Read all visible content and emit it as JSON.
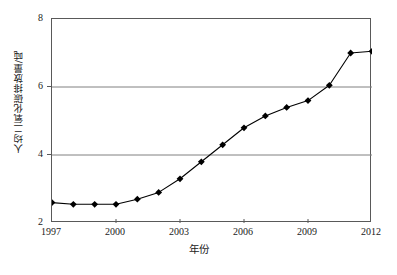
{
  "chart_data": {
    "type": "line",
    "title": "",
    "xlabel": "年份",
    "ylabel": "人均二氧化碳排放量/吨",
    "x": [
      1997,
      1998,
      1999,
      2000,
      2001,
      2002,
      2003,
      2004,
      2005,
      2006,
      2007,
      2008,
      2009,
      2010,
      2011,
      2012
    ],
    "values": [
      2.6,
      2.55,
      2.55,
      2.55,
      2.7,
      2.9,
      3.3,
      3.8,
      4.3,
      4.8,
      5.15,
      5.4,
      5.6,
      6.05,
      7.0,
      7.05
    ],
    "series": [
      {
        "name": "人均二氧化碳排放量",
        "values": [
          2.6,
          2.55,
          2.55,
          2.55,
          2.7,
          2.9,
          3.3,
          3.8,
          4.3,
          4.8,
          5.15,
          5.4,
          5.6,
          6.05,
          7.0,
          7.05
        ]
      }
    ],
    "xlim": [
      1997,
      2012
    ],
    "ylim": [
      2,
      8
    ],
    "xticks": [
      1997,
      2000,
      2003,
      2006,
      2009,
      2012
    ],
    "xtick_labels": [
      "1997",
      "2000",
      "2003",
      "2006",
      "2009",
      "2012"
    ],
    "yticks": [
      2,
      4,
      6,
      8
    ],
    "ytick_labels": [
      "2",
      "4",
      "6",
      "8"
    ],
    "grid": "horizontal",
    "gridlines_at": [
      4,
      6
    ],
    "legend": "none",
    "marker": "diamond",
    "line_color": "#000000",
    "marker_color": "#000000",
    "grid_color": "#808080",
    "axis_color": "#595959",
    "background": "#ffffff"
  },
  "axes": {
    "y_title": "人均二氧化碳排放量/吨",
    "x_title": "年份"
  }
}
